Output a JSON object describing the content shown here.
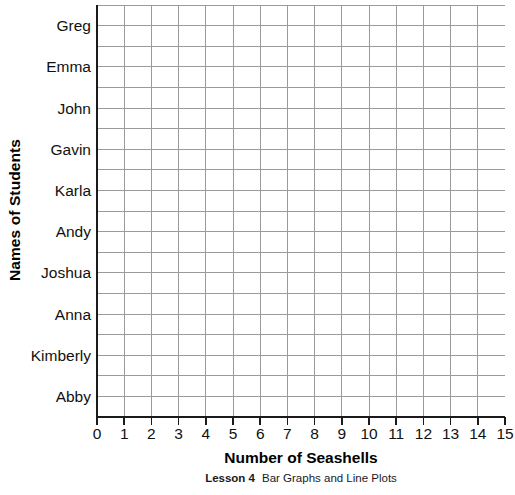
{
  "chart_data": {
    "type": "bar",
    "orientation": "horizontal",
    "title": "",
    "subtitle": "",
    "xlabel": "Number of Seashells",
    "ylabel": "Names of Students",
    "categories": [
      "Greg",
      "Emma",
      "John",
      "Gavin",
      "Karla",
      "Andy",
      "Joshua",
      "Anna",
      "Kimberly",
      "Abby"
    ],
    "values": [
      null,
      null,
      null,
      null,
      null,
      null,
      null,
      null,
      null,
      null
    ],
    "xticks": [
      "0",
      "1",
      "2",
      "3",
      "4",
      "5",
      "6",
      "7",
      "8",
      "9",
      "10",
      "11",
      "12",
      "13",
      "14",
      "15"
    ],
    "xlim": [
      0,
      15
    ],
    "grid": true,
    "grid_columns": 15,
    "grid_rows": 20,
    "legend": null,
    "annotations": [],
    "note": "Blank worksheet grid: no bars drawn",
    "colors": {
      "grid_line": "#9b9b9b",
      "axis_line": "#1a1a1a",
      "background": "#ffffff",
      "text": "#111111"
    }
  },
  "footer": {
    "lesson_label": "Lesson 4",
    "lesson_title": "Bar Graphs and Line Plots"
  }
}
